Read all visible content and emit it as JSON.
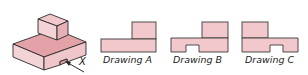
{
  "figure": {
    "object_label": "X",
    "colors": {
      "fill_light": "#f2c8cc",
      "fill_mid": "#e6a6ad",
      "fill_dark": "#d99aa1",
      "stroke": "#2a2a2a"
    },
    "drawings": [
      {
        "label": "Drawing A"
      },
      {
        "label": "Drawing B"
      },
      {
        "label": "Drawing C"
      }
    ]
  }
}
